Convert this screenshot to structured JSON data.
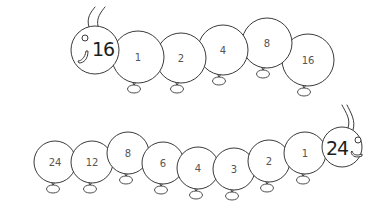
{
  "caterpillars": [
    {
      "id": "top",
      "head": {
        "label": "16",
        "cx": 95,
        "cy": 50,
        "r": 24,
        "facing": "left",
        "eye": {
          "cx": 85,
          "cy": 38,
          "r": 3
        },
        "label_x": 103,
        "label_y": 49
      },
      "segments": [
        {
          "label": "1",
          "cx": 138,
          "cy": 57,
          "r": 26
        },
        {
          "label": "2",
          "cx": 181,
          "cy": 58,
          "r": 25
        },
        {
          "label": "4",
          "cx": 223,
          "cy": 50,
          "r": 25
        },
        {
          "label": "8",
          "cx": 267,
          "cy": 43,
          "r": 25
        },
        {
          "label": "16",
          "cx": 308,
          "cy": 60,
          "r": 26
        }
      ]
    },
    {
      "id": "bottom",
      "head": {
        "label": "24",
        "cx": 342,
        "cy": 147,
        "r": 20,
        "facing": "right",
        "eye": {
          "cx": 358,
          "cy": 140,
          "r": 3
        },
        "label_x": 337,
        "label_y": 148
      },
      "segments": [
        {
          "label": "24",
          "cx": 55,
          "cy": 162,
          "r": 21
        },
        {
          "label": "12",
          "cx": 92,
          "cy": 162,
          "r": 21
        },
        {
          "label": "8",
          "cx": 128,
          "cy": 153,
          "r": 21
        },
        {
          "label": "6",
          "cx": 163,
          "cy": 163,
          "r": 21
        },
        {
          "label": "4",
          "cx": 198,
          "cy": 168,
          "r": 21
        },
        {
          "label": "3",
          "cx": 234,
          "cy": 169,
          "r": 21
        },
        {
          "label": "2",
          "cx": 269,
          "cy": 161,
          "r": 21
        },
        {
          "label": "1",
          "cx": 305,
          "cy": 153,
          "r": 21
        }
      ]
    }
  ],
  "colors": {
    "stroke": "#3a3a3a",
    "segment_text": "#555555",
    "head_text": "#1e1e1e",
    "background": "#ffffff"
  }
}
